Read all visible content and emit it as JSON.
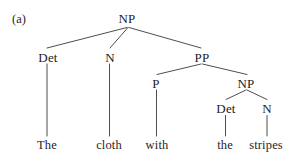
{
  "figure": {
    "label": "(a)",
    "sentence": "The cloth with the stripes",
    "background_color": "#ffffff",
    "line_color": "#3a3a3a",
    "text_color": "#262226"
  },
  "nodes": {
    "root_np": "NP",
    "det1": "Det",
    "n1": "N",
    "pp": "PP",
    "p": "P",
    "np2": "NP",
    "det2": "Det",
    "n2": "N"
  },
  "terminals": {
    "the1": "The",
    "cloth": "cloth",
    "with": "with",
    "the2": "the",
    "stripes": "stripes"
  }
}
